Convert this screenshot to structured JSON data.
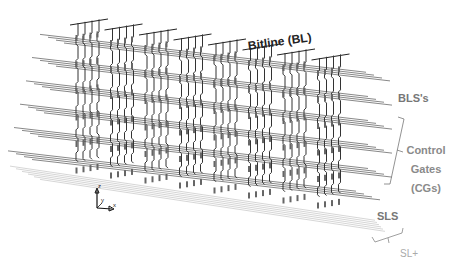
{
  "diagram": {
    "labels": {
      "bitline": "Bitline (BL)",
      "bls": "BLS's",
      "control_gates_line1": "Control",
      "control_gates_line2": "Gates",
      "control_gates_line3": "(CGs)",
      "sls": "SLS",
      "sl_plus": "SL+"
    },
    "axes": {
      "z": "z",
      "y": "y",
      "x": "x"
    },
    "structure": {
      "column_groups": 8,
      "pillars_per_group": 4,
      "line_tiers": [
        "BLS",
        "CG",
        "CG",
        "CG",
        "CG",
        "SLS"
      ],
      "bottom_plate": "SL+"
    },
    "colors": {
      "pillar": "#333333",
      "lines": "#555555",
      "sl_plus_lines": "#bbbbbb",
      "bitline_label": "#222222",
      "side_labels": "#888888"
    }
  }
}
